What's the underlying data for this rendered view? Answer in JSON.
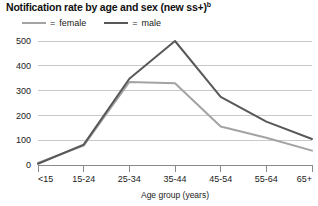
{
  "chart_data": {
    "type": "line",
    "title": "Notification rate by age and sex (new ss+)",
    "title_superscript": "b",
    "xlabel": "Age group (years)",
    "ylabel": "",
    "categories": [
      "<15",
      "15-24",
      "25-34",
      "35-44",
      "45-54",
      "55-64",
      "65+"
    ],
    "series": [
      {
        "name": "female",
        "color": "#a3a3a3",
        "values": [
          8,
          78,
          335,
          330,
          155,
          110,
          58
        ]
      },
      {
        "name": "male",
        "color": "#585858",
        "values": [
          5,
          82,
          348,
          500,
          275,
          175,
          105
        ]
      }
    ],
    "ylim": [
      0,
      500
    ],
    "yticks": [
      0,
      100,
      200,
      300,
      400,
      500
    ],
    "ytick_labels": [
      "0",
      "100",
      "200",
      "300",
      "400",
      "500"
    ],
    "grid": true,
    "legend_position": "top-left",
    "legend_separator": "="
  },
  "colors": {
    "female_line": "#a3a3a3",
    "male_line": "#585858",
    "gridline": "#c9c9c9",
    "axis": "#8a8a8a",
    "text": "#1a1a1a",
    "background": "#ffffff"
  }
}
